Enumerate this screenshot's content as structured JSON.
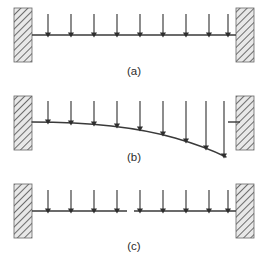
{
  "figure": {
    "background_color": "#ffffff",
    "line_color": "#3a3a3a",
    "wall_hatch_color": "#555555",
    "wall_fill_color": "#e8e8e8",
    "label_color": "#2b2b2b",
    "canvas": {
      "width": 268,
      "height": 265
    }
  },
  "panels": [
    {
      "id": "panel-a",
      "label": "(a)",
      "label_x": 134,
      "label_y": 75,
      "description": "Straight undeformed beam fixed at both ends with uniformly distributed downward load",
      "beam": {
        "type": "straight",
        "x_start": 32,
        "x_end": 236,
        "y": 35,
        "thickness": 1.6,
        "gap": null
      },
      "left_wall": {
        "x": 14,
        "y": 8,
        "width": 18,
        "height": 54
      },
      "right_wall": {
        "x": 236,
        "y": 8,
        "width": 18,
        "height": 54
      },
      "arrow_top_y": 14,
      "arrows": [
        {
          "x": 48,
          "tip_y": 35
        },
        {
          "x": 71,
          "tip_y": 35
        },
        {
          "x": 94,
          "tip_y": 35
        },
        {
          "x": 117,
          "tip_y": 35
        },
        {
          "x": 140,
          "tip_y": 35
        },
        {
          "x": 163,
          "tip_y": 35
        },
        {
          "x": 186,
          "tip_y": 35
        },
        {
          "x": 209,
          "tip_y": 35
        },
        {
          "x": 228,
          "tip_y": 35
        }
      ]
    },
    {
      "id": "panel-b",
      "label": "(b)",
      "label_x": 134,
      "label_y": 161,
      "description": "Deflected beam curve sagging toward the right support with uniformly distributed downward load",
      "beam": {
        "type": "curve",
        "path": "M 32 122 C 90 122, 140 128, 175 138 C 196 144, 212 150, 226 157",
        "x_start": 32,
        "x_end": 226,
        "y": 122,
        "thickness": 1.4,
        "gap": null
      },
      "left_wall": {
        "x": 14,
        "y": 96,
        "width": 18,
        "height": 54
      },
      "right_wall": {
        "x": 236,
        "y": 96,
        "width": 18,
        "height": 54
      },
      "right_stub": {
        "x_start": 228,
        "x_end": 240,
        "y": 122
      },
      "arrow_top_y": 101,
      "arrows": [
        {
          "x": 48,
          "tip_y": 122
        },
        {
          "x": 71,
          "tip_y": 123
        },
        {
          "x": 94,
          "tip_y": 124
        },
        {
          "x": 117,
          "tip_y": 126
        },
        {
          "x": 140,
          "tip_y": 129
        },
        {
          "x": 163,
          "tip_y": 134
        },
        {
          "x": 186,
          "tip_y": 141
        },
        {
          "x": 206,
          "tip_y": 148
        },
        {
          "x": 224,
          "tip_y": 156
        }
      ]
    },
    {
      "id": "panel-c",
      "label": "(c)",
      "label_x": 134,
      "label_y": 250,
      "description": "Beam split into two separate segments with a central gap, both fixed at outer ends, under uniformly distributed downward load",
      "beam": {
        "type": "split",
        "x_start": 32,
        "x_end": 236,
        "y": 211,
        "thickness": 1.6,
        "gap": {
          "x_start": 127,
          "x_end": 134
        }
      },
      "left_wall": {
        "x": 14,
        "y": 184,
        "width": 18,
        "height": 54
      },
      "right_wall": {
        "x": 236,
        "y": 184,
        "width": 18,
        "height": 54
      },
      "arrow_top_y": 190,
      "arrows": [
        {
          "x": 48,
          "tip_y": 211
        },
        {
          "x": 71,
          "tip_y": 211
        },
        {
          "x": 94,
          "tip_y": 211
        },
        {
          "x": 117,
          "tip_y": 211
        },
        {
          "x": 140,
          "tip_y": 211
        },
        {
          "x": 163,
          "tip_y": 211
        },
        {
          "x": 186,
          "tip_y": 211
        },
        {
          "x": 209,
          "tip_y": 211
        },
        {
          "x": 228,
          "tip_y": 211
        }
      ]
    }
  ]
}
